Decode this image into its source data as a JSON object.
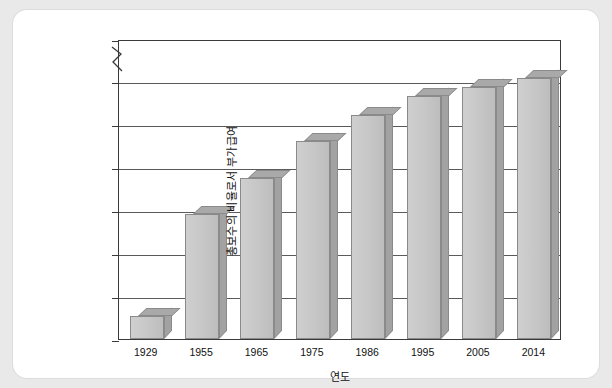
{
  "chart_data": {
    "type": "bar",
    "title": "",
    "xlabel": "연도",
    "ylabel": "총보수의 비율로서 부가급여",
    "categories": [
      "1929",
      "1955",
      "1965",
      "1975",
      "1986",
      "1995",
      "2005",
      "2014"
    ],
    "values": [
      2.7,
      14.5,
      18.7,
      23.0,
      26.0,
      28.2,
      29.3,
      30.4
    ],
    "ylim": [
      0,
      30
    ],
    "yticks": [
      "0",
      "5",
      "10",
      "15",
      "20",
      "25",
      "30",
      "100"
    ],
    "ytick_values": [
      0,
      5,
      10,
      15,
      20,
      25,
      30,
      100
    ],
    "axis_break": true,
    "axis_break_between": [
      30,
      100
    ],
    "grid": "horizontal",
    "legend": "none",
    "bar_color": "#c9c9c9",
    "bar_top_color": "#a9a9a9",
    "bar_side_color": "#a2a2a2",
    "axis_color": "#3a3a3a",
    "grid_color": "#5a5a5a",
    "background": "#ffffff",
    "page_background": "#e9e9e9"
  }
}
